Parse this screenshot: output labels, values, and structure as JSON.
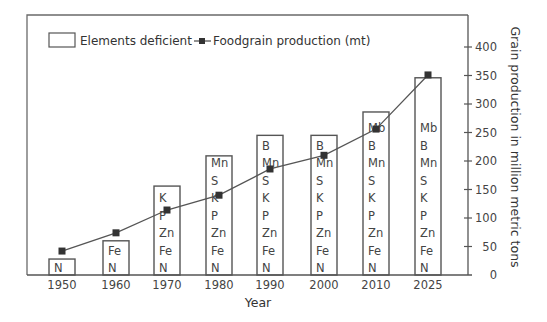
{
  "chart_data": {
    "type": "bar+line",
    "title": "",
    "xlabel": "Year",
    "ylabel": "Grain production in million metric tons",
    "ylim": [
      0,
      430
    ],
    "y_ticks": [
      0,
      50,
      100,
      150,
      200,
      250,
      300,
      350,
      400
    ],
    "categories": [
      "1950",
      "1960",
      "1970",
      "1980",
      "1990",
      "2000",
      "2010",
      "2025"
    ],
    "legend": {
      "bar_label": "Elements deficient",
      "line_label": "Foodgrain production (mt)"
    },
    "series": [
      {
        "name": "Elements deficient",
        "kind": "bar",
        "values": [
          28,
          60,
          156,
          209,
          245,
          245,
          286,
          346
        ],
        "labels": [
          [
            "N"
          ],
          [
            "Fe",
            "N"
          ],
          [
            "K",
            "P",
            "Zn",
            "Fe",
            "N"
          ],
          [
            "Mn",
            "S",
            "K",
            "P",
            "Zn",
            "Fe",
            "N"
          ],
          [
            "B",
            "Mn",
            "S",
            "K",
            "P",
            "Zn",
            "Fe",
            "N"
          ],
          [
            "B",
            "Mn",
            "S",
            "K",
            "P",
            "Zn",
            "Fe",
            "N"
          ],
          [
            "Mb",
            "B",
            "Mn",
            "S",
            "K",
            "P",
            "Zn",
            "Fe",
            "N"
          ],
          [
            "Mb",
            "B",
            "Mn",
            "S",
            "K",
            "P",
            "Zn",
            "Fe",
            "N"
          ]
        ]
      },
      {
        "name": "Foodgrain production (mt)",
        "kind": "line",
        "marker": "square",
        "values": [
          42,
          74,
          114,
          140,
          186,
          210,
          256,
          351
        ]
      }
    ],
    "grid": false,
    "legend_position": "top-left inside",
    "y_axis_side": "right"
  },
  "colors": {
    "line": "#555555",
    "marker": "#333333",
    "bar_fill": "#ffffff",
    "bar_stroke": "#555555"
  }
}
